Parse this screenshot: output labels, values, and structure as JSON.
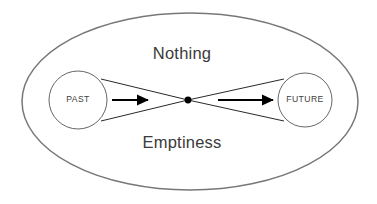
{
  "diagram": {
    "title_visible": false,
    "background_color": "#ffffff",
    "boundary": {
      "name": "outer-ellipse",
      "stroke_color": "#777777",
      "fill_color": "#ffffff",
      "center_x": 190,
      "center_y": 101.5,
      "radius_x": 168,
      "radius_y": 88.5
    },
    "region_labels": [
      {
        "id": "nothing",
        "text": "Nothing",
        "x": 182,
        "y": 55,
        "color": "#3a3a3a"
      },
      {
        "id": "emptiness",
        "text": "Emptiness",
        "x": 182,
        "y": 144,
        "color": "#3a3a3a"
      }
    ],
    "nodes": [
      {
        "id": "past",
        "label": "PAST",
        "center_x": 78,
        "center_y": 100,
        "radius": 29,
        "stroke_color": "#555555",
        "fill_color": "#ffffff"
      },
      {
        "id": "future",
        "label": "FUTURE",
        "center_x": 305,
        "center_y": 100,
        "radius": 27,
        "stroke_color": "#555555",
        "fill_color": "#ffffff"
      }
    ],
    "center_point": {
      "id": "singularity-dot",
      "x": 188,
      "y": 100,
      "radius": 3.4,
      "color": "#000000"
    },
    "cones": [
      {
        "id": "past-cone",
        "apex_x": 188,
        "apex_y": 100,
        "top_x": 101,
        "top_y": 79,
        "bottom_x": 101,
        "bottom_y": 121,
        "stroke_color": "#111111"
      },
      {
        "id": "future-cone",
        "apex_x": 188,
        "apex_y": 100,
        "top_x": 284,
        "top_y": 79,
        "bottom_x": 284,
        "bottom_y": 121,
        "stroke_color": "#111111"
      }
    ],
    "arrows": [
      {
        "id": "past-to-center-arrow",
        "start_x": 112,
        "start_y": 100,
        "end_x": 152,
        "end_y": 100,
        "direction": "right",
        "color": "#000000"
      },
      {
        "id": "center-to-future-arrow",
        "start_x": 218,
        "start_y": 100,
        "end_x": 277,
        "end_y": 100,
        "direction": "right",
        "color": "#000000"
      }
    ]
  }
}
